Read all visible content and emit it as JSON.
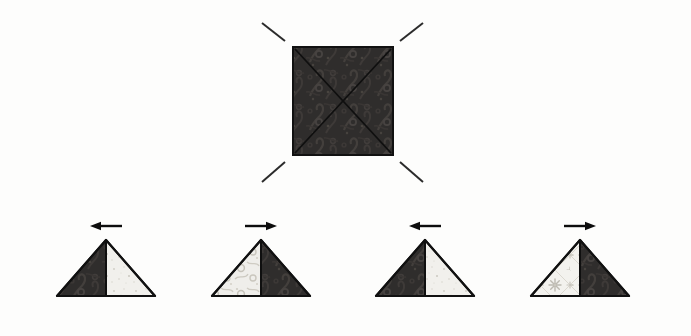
{
  "canvas": {
    "width": 691,
    "height": 336,
    "background_color": "#fdfdfc"
  },
  "palette": {
    "dark_fabric": "#2f2d2c",
    "dark_fabric_shadow": "#1d1c1b",
    "dark_fabric_motif": "#44403d",
    "light_fabric": "#f1f0ec",
    "light_fabric_motif": "#c9c6bd",
    "outline": "#111111",
    "fold_line": "#0f0f0f",
    "dashed_guide": "#2b2b2b",
    "arrow": "#0d0d0d"
  },
  "diagram": {
    "step_count": 5
  },
  "square": {
    "name": "patterned-square",
    "x": 293,
    "y": 47,
    "width": 100,
    "height": 108,
    "fill": "#2f2d2c",
    "stroke": "#111111",
    "stroke_width": 2,
    "fold_lines": [
      {
        "name": "diagonal-tl-br",
        "x1": 294,
        "y1": 48,
        "x2": 392,
        "y2": 154
      },
      {
        "name": "diagonal-tr-bl",
        "x1": 392,
        "y1": 48,
        "x2": 294,
        "y2": 154
      }
    ],
    "center": {
      "x": 343,
      "y": 101
    }
  },
  "guides": [
    {
      "name": "guide-dash-top-left",
      "x1": 262,
      "y1": 23,
      "x2": 285,
      "y2": 41
    },
    {
      "name": "guide-dash-top-right",
      "x1": 400,
      "y1": 41,
      "x2": 423,
      "y2": 23
    },
    {
      "name": "guide-dash-bottom-left",
      "x1": 262,
      "y1": 182,
      "x2": 285,
      "y2": 162
    },
    {
      "name": "guide-dash-bottom-right",
      "x1": 400,
      "y1": 162,
      "x2": 423,
      "y2": 182
    }
  ],
  "triangles": [
    {
      "name": "triangle-1",
      "index": 1,
      "apex_x": 106,
      "apex_y": 240,
      "base_y": 296,
      "half_width": 49,
      "left_half_shade": "dark",
      "right_half_shade": "light",
      "light_pattern": "speckle",
      "arrow_direction": "left",
      "arrow_label": "fold left"
    },
    {
      "name": "triangle-2",
      "index": 2,
      "apex_x": 261,
      "apex_y": 240,
      "base_y": 296,
      "half_width": 49,
      "left_half_shade": "light",
      "right_half_shade": "dark",
      "light_pattern": "scroll",
      "arrow_direction": "right",
      "arrow_label": "fold right"
    },
    {
      "name": "triangle-3",
      "index": 3,
      "apex_x": 425,
      "apex_y": 240,
      "base_y": 296,
      "half_width": 49,
      "left_half_shade": "dark",
      "right_half_shade": "light",
      "light_pattern": "speckle",
      "arrow_direction": "left",
      "arrow_label": "fold left"
    },
    {
      "name": "triangle-4",
      "index": 4,
      "apex_x": 580,
      "apex_y": 240,
      "base_y": 296,
      "half_width": 49,
      "left_half_shade": "light",
      "right_half_shade": "dark",
      "light_pattern": "floral",
      "arrow_direction": "right",
      "arrow_label": "fold right"
    }
  ],
  "arrow_style": {
    "length": 32,
    "offset_above_apex": 14,
    "shaft_thickness": 2.4,
    "head_length": 11,
    "head_half_height": 4.2
  }
}
